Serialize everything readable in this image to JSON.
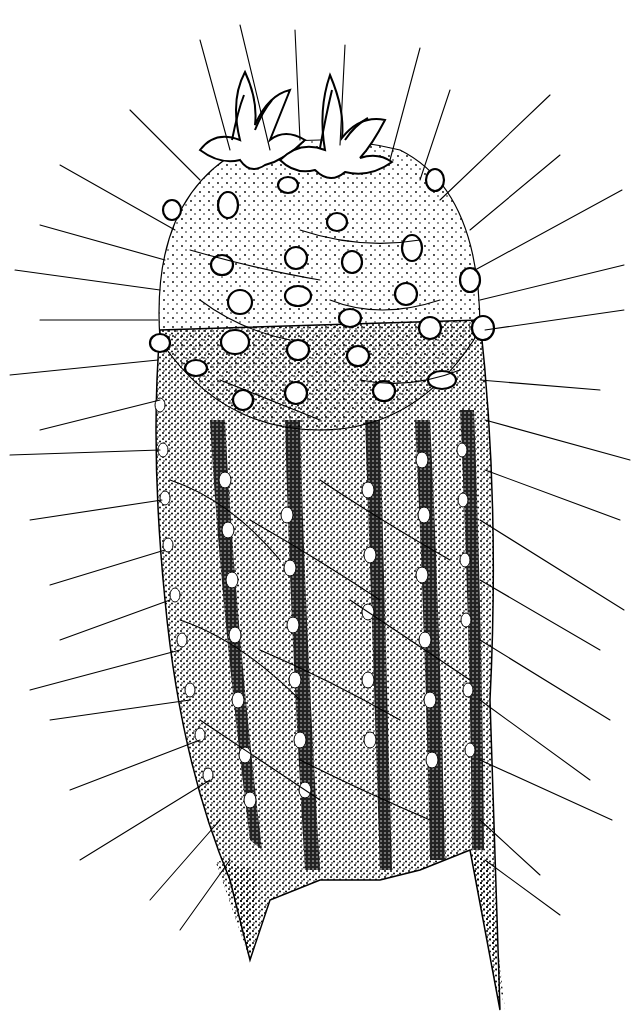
{
  "illustration": {
    "subject": "cactus-stem-with-flower-buds",
    "style": "black-and-white stipple ink drawing",
    "colors": {
      "background": "#ffffff",
      "ink": "#000000"
    },
    "features": {
      "flower_buds": 2,
      "visible_ribs": 6,
      "areole_rows_on_dome": 5,
      "spines": "long slender radiating spines covering the stem"
    }
  }
}
